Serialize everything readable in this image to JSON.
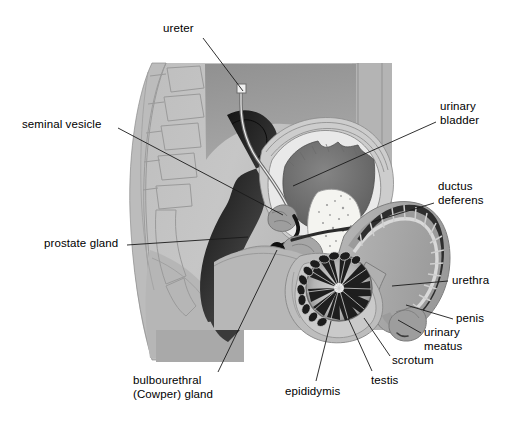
{
  "figure": {
    "background_color": "#ffffff",
    "line_color": "#1a1a1a",
    "width": 511,
    "height": 423
  },
  "palette": {
    "skin_light": "#c9c9c9",
    "skin_mid": "#b3b3b3",
    "muscle_dark": "#8f8f8f",
    "bladder_dark": "#6e6e6e",
    "bladder_wall": "#e8e8e8",
    "rectum_black": "#161616",
    "duct_black": "#0d0d0d",
    "pubis_cream": "#f2f2ee",
    "outline": "#4a4a4a",
    "penis_shaft": "#a0a0a0",
    "testis_dark": "#2a2a2a"
  },
  "labels": [
    {
      "id": "ureter",
      "name": "ureter",
      "text": "ureter",
      "lines": [
        "ureter"
      ],
      "x": 163,
      "y": 22,
      "align": "left",
      "leader": [
        [
          203,
          38
        ],
        [
          243,
          91
        ]
      ]
    },
    {
      "id": "seminal-vesicle",
      "name": "seminal vesicle",
      "text": "seminal vesicle",
      "lines": [
        "seminal vesicle"
      ],
      "x": 22,
      "y": 118,
      "align": "left",
      "leader": [
        [
          118,
          128
        ],
        [
          283,
          215
        ]
      ]
    },
    {
      "id": "urinary-bladder",
      "name": "urinary bladder",
      "text": "urinary bladder",
      "lines": [
        "urinary",
        "bladder"
      ],
      "x": 440,
      "y": 100,
      "align": "left",
      "leader": [
        [
          436,
          122
        ],
        [
          293,
          186
        ]
      ]
    },
    {
      "id": "ductus-deferens",
      "name": "ductus deferens",
      "text": "ductus deferens",
      "lines": [
        "ductus",
        "deferens"
      ],
      "x": 438,
      "y": 180,
      "align": "left",
      "leader": [
        [
          434,
          203
        ],
        [
          372,
          222
        ]
      ]
    },
    {
      "id": "prostate-gland",
      "name": "prostate gland",
      "text": "prostate gland",
      "lines": [
        "prostate gland"
      ],
      "x": 44,
      "y": 237,
      "align": "left",
      "leader": [
        [
          127,
          245
        ],
        [
          248,
          237
        ]
      ]
    },
    {
      "id": "urethra",
      "name": "urethra",
      "text": "urethra",
      "lines": [
        "urethra"
      ],
      "x": 452,
      "y": 274,
      "align": "left",
      "leader": [
        [
          448,
          281
        ],
        [
          392,
          286
        ]
      ]
    },
    {
      "id": "penis",
      "name": "penis",
      "text": "penis",
      "lines": [
        "penis"
      ],
      "x": 456,
      "y": 312,
      "align": "left",
      "leader": [
        [
          453,
          319
        ],
        [
          406,
          305
        ]
      ]
    },
    {
      "id": "urinary-meatus",
      "name": "urinary meatus",
      "text": "urinary meatus",
      "lines": [
        "urinary",
        "meatus"
      ],
      "x": 424,
      "y": 326,
      "align": "left",
      "leader": [
        [
          421,
          333
        ],
        [
          398,
          320
        ]
      ]
    },
    {
      "id": "scrotum",
      "name": "scrotum",
      "text": "scrotum",
      "lines": [
        "scrotum"
      ],
      "x": 392,
      "y": 354,
      "align": "left",
      "leader": [
        [
          390,
          356
        ],
        [
          364,
          318
        ]
      ]
    },
    {
      "id": "testis",
      "name": "testis",
      "text": "testis",
      "lines": [
        "testis"
      ],
      "x": 371,
      "y": 374,
      "align": "left",
      "leader": [
        [
          372,
          371
        ],
        [
          348,
          318
        ]
      ]
    },
    {
      "id": "epididymis",
      "name": "epididymis",
      "text": "epididymis",
      "lines": [
        "epididymis"
      ],
      "x": 285,
      "y": 385,
      "align": "left",
      "leader": [
        [
          316,
          381
        ],
        [
          331,
          321
        ]
      ]
    },
    {
      "id": "bulbourethral-cowper-gland",
      "name": "bulbourethral (Cowper) gland",
      "text": "bulbourethral (Cowper) gland",
      "lines": [
        "bulbourethral",
        "(Cowper) gland"
      ],
      "x": 133,
      "y": 374,
      "align": "left",
      "leader": [
        [
          218,
          372
        ],
        [
          277,
          250
        ]
      ]
    }
  ]
}
